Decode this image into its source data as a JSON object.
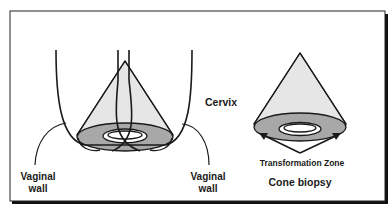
{
  "figure": {
    "labels": {
      "cervix": "Cervix",
      "vaginal_wall_left_line1": "Vaginal",
      "vaginal_wall_left_line2": "wall",
      "vaginal_wall_right_line1": "Vaginal",
      "vaginal_wall_right_line2": "wall",
      "transformation_zone": "Transformation Zone",
      "cone_biopsy": "Cone biopsy"
    },
    "colors": {
      "line": "#1a1a1a",
      "cone_fill": "#e6e6e6",
      "zone_fill": "#a8a8a8",
      "hole_fill": "#ffffff",
      "frame_shadow": "#111111"
    }
  }
}
